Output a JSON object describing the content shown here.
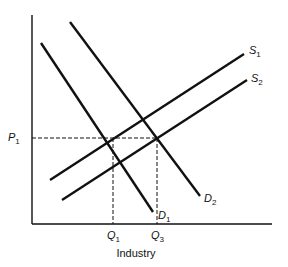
{
  "diagram": {
    "type": "supply-demand",
    "xlabel": "Industry",
    "axes": {
      "origin": [
        32,
        224
      ],
      "y_axis_top": [
        32,
        15
      ],
      "x_axis_right": [
        272,
        224
      ]
    },
    "price_labels": [
      {
        "name": "P",
        "sub": "1",
        "y": 138
      }
    ],
    "quantity_labels": [
      {
        "name": "Q",
        "sub": "1",
        "x": 113
      },
      {
        "name": "Q",
        "sub": "3",
        "x": 157
      }
    ],
    "curves": [
      {
        "id": "D1",
        "name": "D",
        "sub": "1",
        "kind": "demand",
        "from": [
          41,
          43
        ],
        "to": [
          153,
          212
        ],
        "label_pos": [
          158,
          219
        ]
      },
      {
        "id": "D2",
        "name": "D",
        "sub": "2",
        "kind": "demand",
        "from": [
          70,
          22
        ],
        "to": [
          200,
          196
        ],
        "label_pos": [
          204,
          202
        ]
      },
      {
        "id": "S1",
        "name": "S",
        "sub": "1",
        "kind": "supply",
        "from": [
          50,
          180
        ],
        "to": [
          244,
          54
        ],
        "label_pos": [
          249,
          54
        ]
      },
      {
        "id": "S2",
        "name": "S",
        "sub": "2",
        "kind": "supply",
        "from": [
          62,
          200
        ],
        "to": [
          247,
          80
        ],
        "label_pos": [
          251,
          82
        ]
      }
    ],
    "guides": [
      {
        "id": "p1-line",
        "from": [
          32,
          138
        ],
        "to": [
          157,
          138
        ]
      },
      {
        "id": "q1-line",
        "from": [
          113,
          138
        ],
        "to": [
          113,
          224
        ]
      },
      {
        "id": "q3-line",
        "from": [
          157,
          138
        ],
        "to": [
          157,
          224
        ]
      }
    ],
    "colors": {
      "line": "#111111",
      "background": "#ffffff"
    }
  }
}
